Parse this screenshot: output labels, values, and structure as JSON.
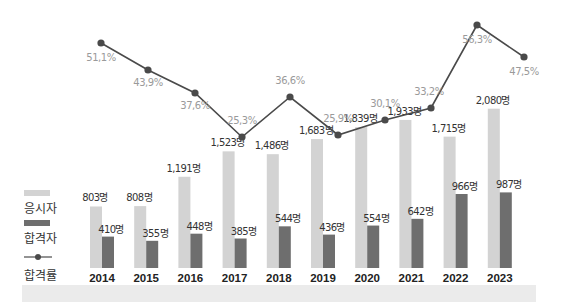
{
  "chart_data": {
    "type": "bar",
    "title": "",
    "xlabel": "",
    "ylabel": "",
    "grid": false,
    "legend_position": "left",
    "categories": [
      "2014",
      "2015",
      "2016",
      "2017",
      "2018",
      "2019",
      "2020",
      "2021",
      "2022",
      "2023"
    ],
    "series": [
      {
        "name": "응시자",
        "type": "bar",
        "color": "#d3d3d3",
        "values": [
          803,
          808,
          1191,
          1523,
          1486,
          1683,
          1839,
          1933,
          1715,
          2080
        ],
        "labels": [
          "803명",
          "808명",
          "1,191명",
          "1,523명",
          "1,486명",
          "1,683명",
          "1,839명",
          "1,933명",
          "1,715명",
          "2,080명"
        ]
      },
      {
        "name": "합격자",
        "type": "bar",
        "color": "#6e6e6e",
        "values": [
          410,
          355,
          448,
          385,
          544,
          436,
          554,
          642,
          966,
          987
        ],
        "labels": [
          "410명",
          "355명",
          "448명",
          "385명",
          "544명",
          "436명",
          "554명",
          "642명",
          "966명",
          "987명"
        ]
      },
      {
        "name": "합격률",
        "type": "line",
        "color": "#4a4a4a",
        "unit": "%",
        "values": [
          51.1,
          43.9,
          37.6,
          25.3,
          36.6,
          25.9,
          30.1,
          33.2,
          56.3,
          47.5
        ],
        "labels": [
          "51,1%",
          "43,9%",
          "37,6%",
          "25,3%",
          "36,6%",
          "25,9%",
          "30,1%",
          "33,2%",
          "56,3%",
          "47,5%"
        ]
      }
    ]
  },
  "legend": {
    "items": [
      {
        "label": "응시자",
        "color": "#d3d3d3",
        "kind": "bar"
      },
      {
        "label": "합격자",
        "color": "#6e6e6e",
        "kind": "bar"
      },
      {
        "label": "합격률",
        "color": "#4a4a4a",
        "kind": "line"
      }
    ]
  },
  "colors": {
    "applicants": "#d3d3d3",
    "passers": "#6e6e6e",
    "rate_line": "#4a4a4a",
    "label_text": "#333333",
    "rate_text": "#9a9a9a",
    "band": "#ebebeb"
  }
}
